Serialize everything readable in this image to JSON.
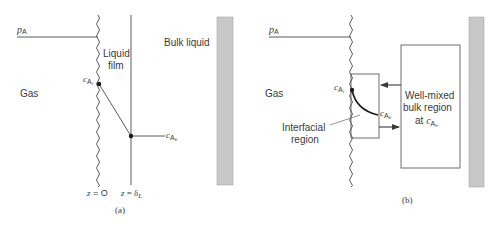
{
  "figure": {
    "panel_a": {
      "caption": "(a)",
      "gas_label": "Gas",
      "pressure_label": {
        "main": "p",
        "sub": "A"
      },
      "film_label_line1": "Liquid",
      "film_label_line2": "film",
      "bulk_label": "Bulk liquid",
      "interface_conc": {
        "main": "c",
        "sub": "A",
        "subsub": "i"
      },
      "bulk_conc": {
        "main": "c",
        "sub": "A",
        "subsub": "b"
      },
      "z0_label": {
        "var": "z",
        "eq": " = O"
      },
      "zdelta_label": {
        "var": "z",
        "eq": " = δ",
        "sub": "L"
      }
    },
    "panel_b": {
      "caption": "(b)",
      "gas_label": "Gas",
      "pressure_label": {
        "main": "p",
        "sub": "A"
      },
      "interface_conc": {
        "main": "c",
        "sub": "A",
        "subsub": "i"
      },
      "bulk_conc": {
        "main": "c",
        "sub": "A",
        "subsub": "b"
      },
      "interfacial_line1": "Interfacial",
      "interfacial_line2": "region",
      "bulk_box_line1": "Well-mixed",
      "bulk_box_line2": "bulk region",
      "bulk_box_line3_prefix": "at ",
      "bulk_box_conc": {
        "main": "c",
        "sub": "A",
        "subsub": "b"
      }
    },
    "colors": {
      "line": "#4a4a4a",
      "wall": "#c8c8c8",
      "wall_edge": "#9a9a9a",
      "text": "#3a3a3a"
    }
  }
}
